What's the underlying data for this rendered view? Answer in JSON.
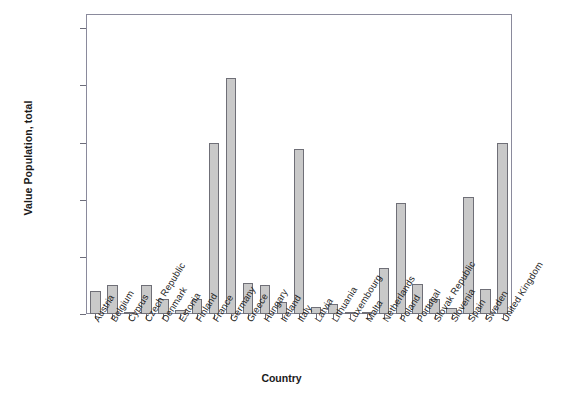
{
  "chart_data": {
    "type": "bar",
    "title": "",
    "xlabel": "Country",
    "ylabel": "Value Population, total",
    "ylim": [
      0,
      105000000
    ],
    "grid": false,
    "legend": "none",
    "y_ticks": [
      0,
      20000000,
      40000000,
      60000000,
      80000000,
      100000000
    ],
    "y_tick_labels": [
      "0",
      "20,000,000",
      "40,000,000",
      "60,000,000",
      "80,000,000",
      "100,000,000"
    ],
    "bar_color": "#c9c9c9",
    "bar_edge_color": "#6f6f77",
    "axis_color": "#8a8a9c",
    "categories": [
      "Austria",
      "Belgium",
      "Cyprus",
      "Czech Republic",
      "Denmark",
      "Estonia",
      "Finland",
      "France",
      "Germany",
      "Greece",
      "Hungary",
      "Ireland",
      "Italy",
      "Latvia",
      "Lithuania",
      "Luxembourg",
      "Malta",
      "Netherlands",
      "Poland",
      "Portugal",
      "Slovak Republic",
      "Slovenia",
      "Spain",
      "Sweden",
      "United Kingdom"
    ],
    "values": [
      8100000,
      10300000,
      800000,
      10300000,
      5400000,
      1300000,
      5200000,
      60000000,
      82500000,
      11000000,
      10100000,
      4100000,
      57900000,
      2300000,
      3400000,
      460000,
      400000,
      16100000,
      38900000,
      10400000,
      5400000,
      2000000,
      40800000,
      8900000,
      59700000
    ]
  }
}
